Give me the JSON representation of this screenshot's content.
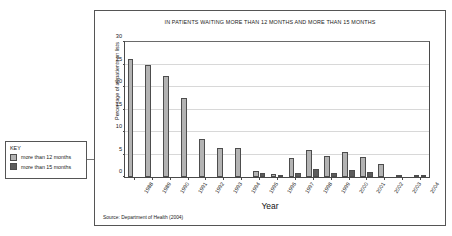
{
  "chart_data": {
    "type": "bar",
    "title": "IN PATIENTS WAITING MORE THAN 12 MONTHS AND MORE THAN 15 MONTHS",
    "xlabel": "Year",
    "ylabel": "Percentage of all patients on lists",
    "ylim": [
      0,
      30
    ],
    "yticks": [
      0,
      5,
      10,
      15,
      20,
      25,
      30
    ],
    "grid": true,
    "legend_position": "left-outside",
    "source": "Source: Department of Health (2004)",
    "categories": [
      "1988",
      "1989",
      "1990",
      "1991",
      "1992",
      "1993",
      "1994",
      "1995",
      "1996",
      "1997",
      "1998",
      "1999",
      "2000",
      "2001",
      "2002",
      "2003",
      "2004"
    ],
    "series": [
      {
        "name": "more than 12 months",
        "color": "#b3b3b3",
        "values": [
          26.2,
          25.0,
          22.5,
          17.5,
          8.5,
          6.4,
          6.4,
          1.3,
          0.6,
          4.2,
          6.1,
          4.6,
          5.5,
          4.5,
          2.8,
          0.3,
          0.3
        ]
      },
      {
        "name": "more than 15 months",
        "color": "#5c5c5c",
        "values": [
          0,
          0,
          0,
          0,
          0,
          0,
          0,
          0.9,
          0.1,
          1.0,
          1.7,
          0.9,
          1.5,
          1.2,
          0,
          0,
          0.2
        ]
      }
    ]
  },
  "legend": {
    "title": "KEY",
    "items": [
      {
        "label": "more than 12 months",
        "color": "#b3b3b3"
      },
      {
        "label": "more than 15 months",
        "color": "#5c5c5c"
      }
    ]
  }
}
